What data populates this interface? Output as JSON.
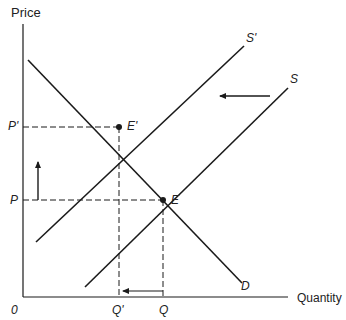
{
  "diagram": {
    "type": "supply-demand",
    "axes": {
      "y_label": "Price",
      "x_label": "Quantity",
      "origin_label": "0"
    },
    "price_levels": [
      {
        "label": "P'",
        "y": 127
      },
      {
        "label": "P",
        "y": 200
      }
    ],
    "quantity_levels": [
      {
        "label": "Q'",
        "x": 119
      },
      {
        "label": "Q",
        "x": 163
      }
    ],
    "curves": [
      {
        "name": "S'",
        "label": "S'",
        "x1": 36,
        "y1": 242,
        "x2": 244,
        "y2": 46
      },
      {
        "name": "S",
        "label": "S",
        "x1": 85,
        "y1": 287,
        "x2": 288,
        "y2": 88
      },
      {
        "name": "D",
        "label": "D",
        "x1": 28,
        "y1": 60,
        "x2": 242,
        "y2": 283
      }
    ],
    "equilibria": [
      {
        "label": "E'",
        "x": 119,
        "y": 127
      },
      {
        "label": "E",
        "x": 163,
        "y": 200
      }
    ],
    "arrows": [
      {
        "name": "supply-shift-arrow",
        "direction": "left",
        "x1": 270,
        "y1": 96,
        "x2": 218,
        "y2": 96
      },
      {
        "name": "price-increase-arrow",
        "direction": "up",
        "x1": 38,
        "y1": 200,
        "x2": 38,
        "y2": 160
      },
      {
        "name": "quantity-decrease-arrow",
        "direction": "left",
        "x1": 163,
        "y1": 291,
        "x2": 121,
        "y2": 291
      }
    ],
    "colors": {
      "line": "#1a1a1a",
      "background": "#ffffff"
    }
  }
}
